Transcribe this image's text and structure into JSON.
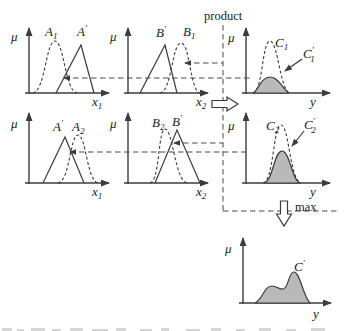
{
  "labels": {
    "mu": "μ",
    "product": "product",
    "max": "max",
    "a1": {
      "base": "A",
      "sub": "1"
    },
    "a_prime": {
      "base": "A",
      "sup": "′"
    },
    "a2": {
      "base": "A",
      "sub": "2"
    },
    "b1": {
      "base": "B",
      "sub": "1"
    },
    "b_prime": {
      "base": "B",
      "sup": "′"
    },
    "b2": {
      "base": "B",
      "sub": "2"
    },
    "c1": {
      "base": "C",
      "sub": "1"
    },
    "c1_prime": {
      "base": "C",
      "sup": "′",
      "sub": "1"
    },
    "c2": {
      "base": "C",
      "sub": "2"
    },
    "c2_prime": {
      "base": "C",
      "sup": "′",
      "sub": "2"
    },
    "c_prime": {
      "base": "C",
      "sup": "′"
    },
    "x1": {
      "base": "x",
      "sub": "1"
    },
    "x2": {
      "base": "x",
      "sub": "2"
    },
    "y": {
      "base": "y"
    }
  },
  "colors": {
    "membership_fill": "#b9b9b9",
    "line": "#3c3c3c"
  }
}
